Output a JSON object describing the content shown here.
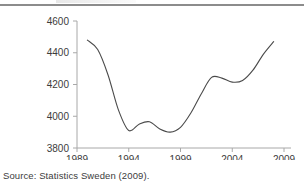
{
  "figure": {
    "source_note": "Source: Statistics Sweden (2009).",
    "axis_color": "#a8a8a8",
    "line_color": "#4a4a4a",
    "tick_label_color": "#3c3c3c",
    "rule_color": "#8c8c8c"
  },
  "chart_data": {
    "type": "line",
    "title": "",
    "subtitle": "",
    "xlabel": "",
    "ylabel": "",
    "xlim": [
      1989,
      2009
    ],
    "ylim": [
      3800,
      4600
    ],
    "grid": false,
    "legend": false,
    "legend_position": "none",
    "y_ticks": [
      3800,
      4000,
      4200,
      4400,
      4600
    ],
    "y_tick_labels": [
      "3800",
      "4000",
      "4200",
      "4400",
      "4600"
    ],
    "x_ticks": [
      1989,
      1994,
      1999,
      2004,
      2009
    ],
    "x_tick_labels": [
      "1989",
      "1994",
      "1999",
      "2004",
      "2009"
    ],
    "series": [
      {
        "name": "Sweden",
        "x": [
          1990,
          1991,
          1992,
          1993,
          1994,
          1995,
          1996,
          1997,
          1998,
          1999,
          2000,
          2001,
          2002,
          2003,
          2004,
          2005,
          2006,
          2007,
          2008
        ],
        "values": [
          4480,
          4420,
          4260,
          4040,
          3910,
          3950,
          3965,
          3920,
          3900,
          3930,
          4020,
          4140,
          4245,
          4240,
          4215,
          4225,
          4290,
          4390,
          4470
        ]
      }
    ]
  }
}
